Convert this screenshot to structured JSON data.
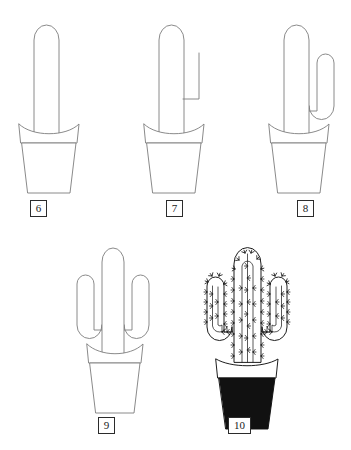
{
  "sheet": {
    "title": "Cactus drawing tutorial — steps 6 to 10",
    "background_color": "#ffffff",
    "outline_color": "#7d7d7d",
    "ink_color": "#1a1a1a",
    "fill_color": "#111111",
    "columns": 3,
    "rows": 2
  },
  "steps": [
    {
      "number": "6",
      "name": "step-6",
      "caption": "6",
      "description": "Tall rounded main stem rising from an empty terracotta pot",
      "has_right_arm": false,
      "has_left_arm": false,
      "has_spines": false,
      "pot_filled": false
    },
    {
      "number": "7",
      "name": "step-7",
      "caption": "7",
      "description": "Main stem plus the outer L-shaped guide line of the right arm",
      "has_right_arm": "partial",
      "has_left_arm": false,
      "has_spines": false,
      "pot_filled": false
    },
    {
      "number": "8",
      "name": "step-8",
      "caption": "8",
      "description": "Right arm completed as a closed hook shape",
      "has_right_arm": true,
      "has_left_arm": false,
      "has_spines": false,
      "pot_filled": false
    },
    {
      "number": "9",
      "name": "step-9",
      "caption": "9",
      "description": "Left arm added, mirroring the right arm",
      "has_right_arm": true,
      "has_left_arm": true,
      "has_spines": false,
      "pot_filled": false
    },
    {
      "number": "10",
      "name": "step-10",
      "caption": "10",
      "description": "Finished drawing with vertical ribs, spines and a solid black pot",
      "has_right_arm": true,
      "has_left_arm": true,
      "has_spines": true,
      "pot_filled": true
    }
  ]
}
